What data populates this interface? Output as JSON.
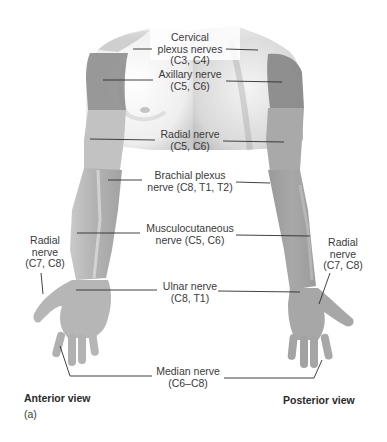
{
  "figure": {
    "panel_label": "(a)",
    "views": {
      "anterior": "Anterior view",
      "posterior": "Posterior view"
    },
    "labels": {
      "cervical": {
        "line1": "Cervical",
        "line2": "plexus nerves",
        "line3": "(C3, C4)"
      },
      "axillary": {
        "line1": "Axillary nerve",
        "line2": "(C5, C6)"
      },
      "radial_upper": {
        "line1": "Radial nerve",
        "line2": "(C5, C6)"
      },
      "brachial": {
        "line1": "Brachial plexus",
        "line2": "nerve (C8, T1, T2)"
      },
      "musculocutaneous": {
        "line1": "Musculocutaneous",
        "line2": "nerve (C5, C6)"
      },
      "radial_left": {
        "line1": "Radial",
        "line2": "nerve",
        "line3": "(C7, C8)"
      },
      "radial_right": {
        "line1": "Radial",
        "line2": "nerve",
        "line3": "(C7, C8)"
      },
      "ulnar": {
        "line1": "Ulnar nerve",
        "line2": "(C8, T1)"
      },
      "median": {
        "line1": "Median nerve",
        "line2": "(C6–C8)"
      }
    },
    "colors": {
      "skin_light": "#d9d9d9",
      "skin_mid": "#b5b5b5",
      "skin_dark": "#8f8f8f",
      "axillary_patch": "#8a8a8a",
      "leader_line": "#2e2e2e",
      "text": "#3a3a3a"
    }
  }
}
